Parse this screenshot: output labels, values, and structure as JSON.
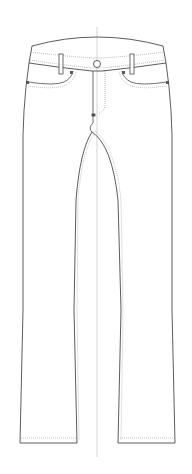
{
  "figure": {
    "subject": "technical flat sketch of jeans (front view)",
    "colors": {
      "background": "#ffffff",
      "outline": "#4a4a4a",
      "stitch": "#9a9a9a",
      "center_line": "#c8c8c8",
      "hardware": "#5a5a5a"
    },
    "parts": [
      "waistband",
      "button",
      "belt-loops",
      "front-pockets",
      "coin-rivets",
      "fly",
      "left-leg",
      "right-leg",
      "hems",
      "center-line"
    ]
  }
}
